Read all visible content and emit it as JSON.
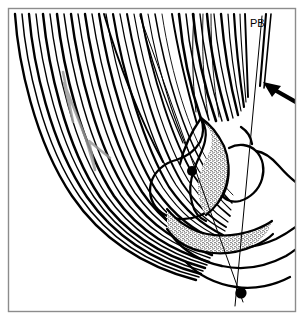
{
  "figure": {
    "kind": "anatomical-line-drawing",
    "width": 304,
    "height": 320,
    "background_color": "#ffffff",
    "ink_color": "#000000",
    "accent_gray": "#9a9a9a",
    "border": {
      "name": "figure-border",
      "color": "#8c8c8c",
      "inset_px": 8,
      "stroke_px": 1
    },
    "labels": [
      {
        "id": "pb",
        "text": "PB",
        "x": 251,
        "y": 26,
        "font_size": 11
      }
    ],
    "markers": [
      {
        "id": "upper-landmark-dot",
        "x": 192,
        "y": 171,
        "r": 5
      },
      {
        "id": "lower-landmark-dot",
        "x": 241,
        "y": 293,
        "r": 5
      }
    ],
    "pointer": {
      "id": "annotation-arrow",
      "tail_x": 303,
      "tail_y": 105,
      "head_x": 265,
      "head_y": 83,
      "direction": "up-left"
    },
    "measurement_lines": [
      {
        "id": "axis-line-a",
        "from_x": 140,
        "from_y": 16,
        "to_x": 241,
        "to_y": 300,
        "through_marker": "upper-landmark-dot"
      },
      {
        "id": "axis-line-b",
        "from_x": 261,
        "from_y": 16,
        "to_x": 236,
        "to_y": 305,
        "through_marker": "lower-landmark-dot"
      }
    ],
    "fiber_bundles": [
      {
        "id": "left-fiber-bundle",
        "count": 22,
        "description": "dense curved striations sweeping from upper-left down to lower-right"
      },
      {
        "id": "upper-right-fiber-bundle",
        "count": 14,
        "description": "fan of striations converging downward at upper right"
      },
      {
        "id": "sparse-mid-fibers",
        "count": 3,
        "description": "three isolated long strokes crossing the upper middle"
      }
    ],
    "stipple_regions": [
      {
        "id": "upper-stipple-band",
        "description": "narrow stippled band along the upper inner contour"
      },
      {
        "id": "lower-stipple-band",
        "description": "broad stippled crescent along the lower inner contour"
      }
    ],
    "zigzag": {
      "id": "gray-zigzag-marker",
      "color": "#9a9a9a",
      "description": "light gray zigzag overlay across the left fiber bundle"
    }
  }
}
